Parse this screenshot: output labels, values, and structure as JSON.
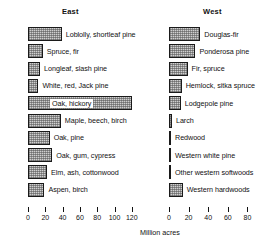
{
  "figure": {
    "axis_title": "Million acres",
    "units": "Million acres"
  },
  "chart_data": {
    "type": "bar",
    "orientation": "horizontal",
    "title": "",
    "xlabel": "Million acres",
    "ylabel": "",
    "grid": false,
    "legend": "none",
    "panels": [
      {
        "name": "east",
        "title": "East",
        "xlim": [
          0,
          130
        ],
        "xticks": [
          0,
          20,
          40,
          60,
          80,
          100,
          120
        ],
        "xtick_labels": [
          "0",
          "20",
          "40",
          "60",
          "80",
          "100",
          "120"
        ],
        "categories": [
          "Loblolly, shortleaf pine",
          "Spruce, fir",
          "Longleaf, slash pine",
          "White, red, Jack pine",
          "Oak, hickory",
          "Maple, beech, birch",
          "Oak, pine",
          "Oak, gum, cypress",
          "Elm, ash, cottonwood",
          "Aspen, birch"
        ],
        "values": [
          39,
          17,
          14,
          12,
          120,
          38,
          25,
          28,
          22,
          19
        ],
        "label_inside": [
          false,
          false,
          false,
          false,
          true,
          false,
          false,
          false,
          false,
          false
        ]
      },
      {
        "name": "west",
        "title": "West",
        "xlim": [
          0,
          90
        ],
        "xticks": [
          0,
          20,
          40,
          60,
          80
        ],
        "xtick_labels": [
          "0",
          "20",
          "40",
          "60",
          "80"
        ],
        "categories": [
          "Douglas-fir",
          "Ponderosa pine",
          "Fir, spruce",
          "Hemlock, sitka spruce",
          "Lodgepole pine",
          "Larch",
          "Redwood",
          "Western white pine",
          "Other western softwoods",
          "Western hardwoods"
        ],
        "values": [
          32,
          27,
          19,
          13,
          12,
          3,
          2,
          1.5,
          2,
          14
        ],
        "label_inside": [
          false,
          false,
          false,
          false,
          false,
          false,
          false,
          false,
          false,
          false
        ]
      }
    ]
  }
}
